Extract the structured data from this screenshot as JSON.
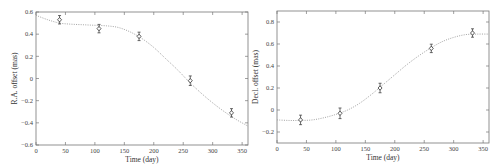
{
  "chart_data": [
    {
      "type": "scatter",
      "title": "",
      "xlabel": "Time (day)",
      "ylabel": "R.A. offset (mas)",
      "xlim": [
        0,
        360
      ],
      "ylim": [
        -0.6,
        0.6
      ],
      "xticks": [
        0,
        50,
        100,
        150,
        200,
        250,
        300,
        350
      ],
      "yticks": [
        -0.6,
        -0.4,
        -0.2,
        0,
        0.2,
        0.4,
        0.6
      ],
      "ytick_labels": [
        "−0.6",
        "−0.4",
        "−0.2",
        "0",
        "0.2",
        "0.4",
        "0.6"
      ],
      "grid": false,
      "legend": null,
      "series": [
        {
          "name": "measurements",
          "marker": "diamond-with-errorbar",
          "x": [
            40,
            107,
            175,
            262,
            332
          ],
          "y": [
            0.53,
            0.45,
            0.38,
            -0.02,
            -0.31
          ],
          "yerr": [
            0.02,
            0.02,
            0.02,
            0.025,
            0.02
          ]
        },
        {
          "name": "model fit",
          "style": "dotted",
          "x": [
            0,
            20,
            40,
            60,
            80,
            100,
            120,
            140,
            160,
            180,
            200,
            220,
            240,
            260,
            280,
            300,
            320,
            340,
            360
          ],
          "y": [
            0.57,
            0.53,
            0.5,
            0.49,
            0.485,
            0.48,
            0.475,
            0.46,
            0.42,
            0.36,
            0.28,
            0.18,
            0.08,
            -0.03,
            -0.13,
            -0.22,
            -0.3,
            -0.37,
            -0.43
          ]
        }
      ]
    },
    {
      "type": "scatter",
      "title": "",
      "xlabel": "Time (day)",
      "ylabel": "Decl. offset (mas)",
      "xlim": [
        0,
        360
      ],
      "ylim": [
        -0.3,
        0.9
      ],
      "xticks": [
        0,
        50,
        100,
        150,
        200,
        250,
        300,
        350
      ],
      "yticks": [
        -0.2,
        0,
        0.2,
        0.4,
        0.6,
        0.8
      ],
      "ytick_labels": [
        "−0.2",
        "0",
        "0.2",
        "0.4",
        "0.6",
        "0.8"
      ],
      "grid": false,
      "legend": null,
      "series": [
        {
          "name": "measurements",
          "marker": "diamond-with-errorbar",
          "x": [
            40,
            107,
            175,
            262,
            332
          ],
          "y": [
            -0.09,
            -0.03,
            0.2,
            0.56,
            0.7
          ],
          "yerr": [
            0.025,
            0.03,
            0.025,
            0.02,
            0.02
          ]
        },
        {
          "name": "model fit",
          "style": "dotted",
          "x": [
            0,
            20,
            40,
            60,
            80,
            100,
            120,
            140,
            160,
            180,
            200,
            220,
            240,
            260,
            280,
            300,
            320,
            340,
            360
          ],
          "y": [
            -0.09,
            -0.095,
            -0.095,
            -0.09,
            -0.07,
            -0.04,
            0.0,
            0.06,
            0.14,
            0.23,
            0.32,
            0.41,
            0.49,
            0.56,
            0.62,
            0.66,
            0.685,
            0.69,
            0.69
          ]
        }
      ]
    }
  ],
  "panels": [
    {
      "xlabel": "Time (day)",
      "ylabel": "R.A. offset (mas)"
    },
    {
      "xlabel": "Time (day)",
      "ylabel": "Decl. offset (mas)"
    }
  ]
}
